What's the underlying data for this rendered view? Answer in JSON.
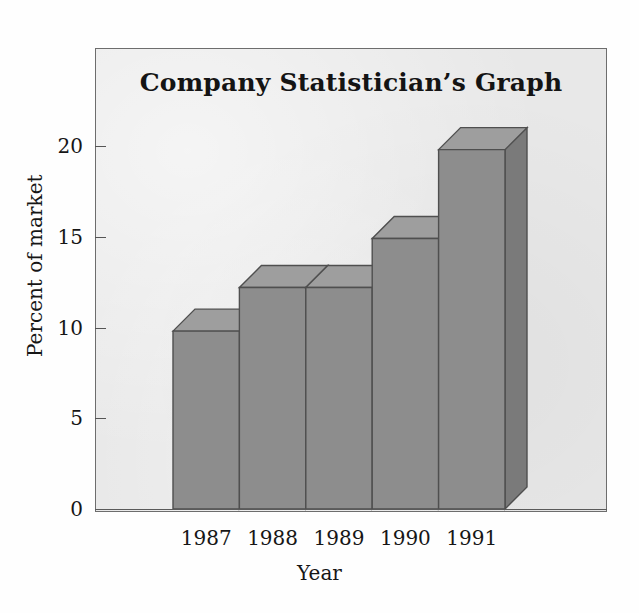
{
  "chart_data": {
    "type": "bar",
    "title": "Company Statistician’s Graph",
    "xlabel": "Year",
    "ylabel": "Percent of market",
    "categories": [
      "1987",
      "1988",
      "1989",
      "1990",
      "1991"
    ],
    "values": [
      9.8,
      12.2,
      12.2,
      14.9,
      19.8
    ],
    "ylim": [
      0,
      23
    ],
    "yticks": [
      "0",
      "5",
      "10",
      "15",
      "20"
    ],
    "ytick_values": [
      0,
      5,
      10,
      15,
      20
    ],
    "grid": false,
    "legend": "none",
    "style": "3d-bar",
    "colors": {
      "bar_front": "#8d8d8d",
      "bar_top": "#9e9e9e",
      "bar_side": "#7a7a7a",
      "bar_edge": "#4f4f4f",
      "panel_background": "#e8e8e8",
      "frame": "#6d6d6d",
      "text": "#161616"
    }
  }
}
